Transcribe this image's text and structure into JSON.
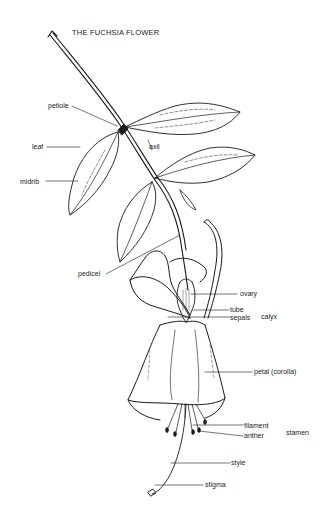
{
  "title": "THE FUCHSIA FLOWER",
  "labels": {
    "petiole": "petiole",
    "leaf": "leaf",
    "axil": "axil",
    "midrib": "midrib",
    "pedicel": "pedicel",
    "ovary": "ovary",
    "tube": "tube",
    "sepals": "sepals",
    "calyx": "calyx",
    "petal": "petal (corolla)",
    "filament": "filament",
    "anther": "anther",
    "stamen": "stamen",
    "style": "style",
    "stigma": "stigma"
  }
}
